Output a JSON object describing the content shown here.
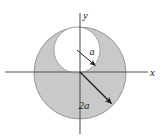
{
  "figure": {
    "canvas": {
      "width": 165,
      "height": 140,
      "background": "#ffffff"
    },
    "axes": {
      "x_label": "x",
      "y_label": "y",
      "color": "#555555",
      "origin": {
        "x": 80,
        "y": 72
      },
      "x_axis": {
        "x1": 5,
        "y1": 72,
        "x2": 148,
        "y2": 72
      },
      "y_axis": {
        "x1": 80,
        "y1": 13,
        "x2": 80,
        "y2": 134
      }
    },
    "shapes": {
      "outer_circle": {
        "name": "outer-shaded-circle",
        "cx": 80,
        "cy": 73,
        "r": 46,
        "fill": "#c9c9c9",
        "stroke": "#8a8a8a",
        "radius_symbol": "2a"
      },
      "inner_circle": {
        "name": "inner-white-circle",
        "cx": 77,
        "cy": 50,
        "r": 23,
        "fill": "#ffffff",
        "stroke": "#9a9a9a",
        "radius_symbol": "a"
      }
    },
    "annotations": [
      {
        "name": "inner-radius-arrow",
        "label": "a",
        "label_x": 92,
        "label_y": 54,
        "from": {
          "x": 77,
          "y": 50
        },
        "to": {
          "x": 97,
          "y": 67
        },
        "color": "#1a1a1a"
      },
      {
        "name": "outer-radius-arrow",
        "label": "2a",
        "label_x": 84,
        "label_y": 108,
        "from": {
          "x": 80,
          "y": 72
        },
        "to": {
          "x": 114,
          "y": 106
        },
        "color": "#1a1a1a"
      }
    ]
  }
}
